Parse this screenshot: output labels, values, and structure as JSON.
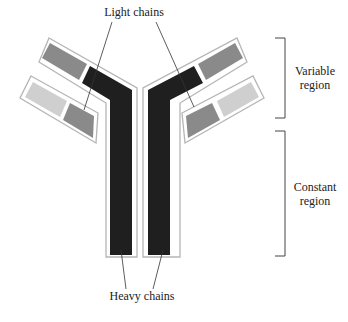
{
  "diagram": {
    "labels": {
      "light_chains": "Light chains",
      "heavy_chains": "Heavy chains",
      "variable_region_line1": "Variable",
      "variable_region_line2": "region",
      "constant_region_line1": "Constant",
      "constant_region_line2": "region"
    },
    "colors": {
      "heavy_chain": "#1f1f1f",
      "light_chain_variable": "#c8c8c8",
      "light_chain_constant": "#8a8a8a",
      "heavy_chain_variable_domain": "#8a8a8a",
      "outline": "#b5b5b5",
      "leader_line": "#333333",
      "bracket": "#444444"
    }
  }
}
